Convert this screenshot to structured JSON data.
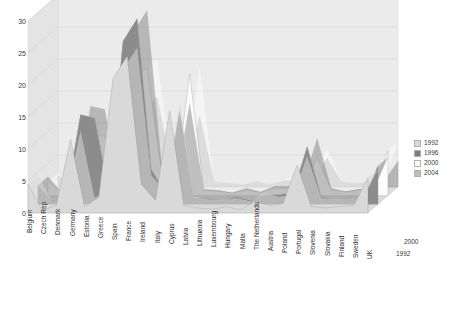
{
  "chart_data": {
    "type": "area",
    "title": "",
    "subtitle": "",
    "xlabel": "",
    "ylabel": "",
    "zlabel": "",
    "ylim": [
      0,
      30
    ],
    "yticks": [
      0,
      5,
      10,
      15,
      20,
      25,
      30
    ],
    "grid": true,
    "legend_position": "right",
    "depth_axis_labels": [
      "2000",
      "1992"
    ],
    "categories": [
      "Belgium",
      "Czech Rep",
      "Denmark",
      "Germany",
      "Estonia",
      "Greece",
      "Spain",
      "France",
      "Ireland",
      "Italy",
      "Cyprus",
      "Latvia",
      "Lithuania",
      "Luxembourg",
      "Hungary",
      "Malta",
      "The Netherlands",
      "Austria",
      "Poland",
      "Portugal",
      "Slovenia",
      "Slovakia",
      "Finland",
      "Sweden",
      "UK"
    ],
    "series": [
      {
        "name": "1992",
        "color": "#d9d9d9",
        "values": [
          4.5,
          0.4,
          1.2,
          11.5,
          1.0,
          2.5,
          21.0,
          24.5,
          4.5,
          2.0,
          16.0,
          1.2,
          0.8,
          0.6,
          1.0,
          0.5,
          1.8,
          1.2,
          1.5,
          7.5,
          1.0,
          0.8,
          1.0,
          1.2,
          5.5
        ]
      },
      {
        "name": "1996",
        "color": "#8c8c8c",
        "values": [
          3.0,
          0.5,
          1.0,
          14.0,
          13.5,
          2.0,
          25.5,
          29.0,
          5.5,
          1.8,
          14.5,
          1.0,
          0.9,
          0.5,
          1.2,
          0.6,
          1.5,
          1.5,
          1.8,
          9.0,
          1.2,
          0.7,
          1.1,
          1.0,
          6.0
        ]
      },
      {
        "name": "2000",
        "color": "#fcfcfc",
        "values": [
          2.2,
          0.4,
          0.9,
          9.0,
          9.5,
          1.5,
          18.0,
          20.0,
          4.0,
          1.5,
          19.0,
          0.9,
          0.7,
          0.4,
          0.9,
          0.5,
          1.2,
          1.1,
          1.4,
          6.0,
          0.9,
          0.6,
          0.9,
          0.9,
          7.0
        ]
      },
      {
        "name": "2004",
        "color": "#b5b5b5",
        "values": [
          1.8,
          0.3,
          0.7,
          6.5,
          5.0,
          1.2,
          12.0,
          14.0,
          3.0,
          1.2,
          11.0,
          0.8,
          0.6,
          0.3,
          0.8,
          0.4,
          1.0,
          0.9,
          1.1,
          4.5,
          0.8,
          0.5,
          0.8,
          0.8,
          4.0
        ]
      }
    ]
  },
  "legend": {
    "items": [
      {
        "label": "1992",
        "color": "#d9d9d9"
      },
      {
        "label": "1996",
        "color": "#7d7d7d"
      },
      {
        "label": "2000",
        "color": "#fdfdfd"
      },
      {
        "label": "2004",
        "color": "#bdbdbd"
      }
    ]
  },
  "depth_axis": {
    "top": "2000",
    "bottom": "1992"
  },
  "colors": {
    "wall_back": "#ebebeb",
    "wall_side": "#e4e4e4",
    "floor": "#dcdcdc",
    "gridline": "#cfcfcf",
    "text": "#3a3a3a"
  }
}
